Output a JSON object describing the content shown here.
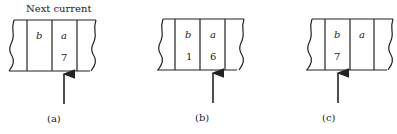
{
  "heading": "Next current",
  "panels": [
    {
      "caption": "(a)",
      "cells": [
        {
          "var": "b",
          "value": ""
        },
        {
          "var": "a",
          "value": "7"
        }
      ],
      "pointer_cell": "a"
    },
    {
      "caption": "(b)",
      "cells": [
        {
          "var": "b",
          "value": "1"
        },
        {
          "var": "a",
          "value": "6"
        }
      ],
      "pointer_cell": "a"
    },
    {
      "caption": "(c)",
      "cells": [
        {
          "var": "b",
          "value": "7"
        },
        {
          "var": "a",
          "value": ""
        }
      ],
      "pointer_cell": "b"
    }
  ],
  "colors": {
    "ink": "#222222",
    "background": "#ffffff"
  }
}
